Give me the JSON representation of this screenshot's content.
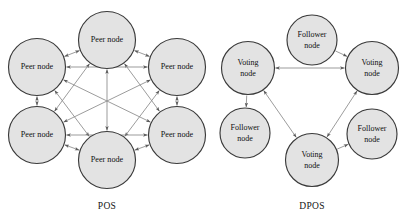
{
  "figure": {
    "background_color": "#ffffff",
    "node_fill_color": "#e3e3e3",
    "node_stroke_color": "#3a3a3a",
    "edge_color": "#8a8a8a"
  },
  "diagrams": [
    {
      "id": "pos",
      "caption": "POS",
      "nodes": [
        {
          "id": "pos-n1",
          "label_line1": "Peer node",
          "label_line2": "",
          "cx": 107,
          "cy": 40,
          "r": 28.5
        },
        {
          "id": "pos-n2",
          "label_line1": "Peer node",
          "label_line2": "",
          "cx": 37,
          "cy": 67,
          "r": 28.5
        },
        {
          "id": "pos-n3",
          "label_line1": "Peer node",
          "label_line2": "",
          "cx": 177,
          "cy": 67,
          "r": 28.5
        },
        {
          "id": "pos-n4",
          "label_line1": "Peer node",
          "label_line2": "",
          "cx": 37,
          "cy": 135,
          "r": 28.5
        },
        {
          "id": "pos-n5",
          "label_line1": "Peer node",
          "label_line2": "",
          "cx": 177,
          "cy": 135,
          "r": 28.5
        },
        {
          "id": "pos-n6",
          "label_line1": "Peer node",
          "label_line2": "",
          "cx": 107,
          "cy": 160,
          "r": 28.5
        }
      ],
      "edges": [
        {
          "from": "pos-n1",
          "to": "pos-n2",
          "bidirectional": true
        },
        {
          "from": "pos-n1",
          "to": "pos-n3",
          "bidirectional": true
        },
        {
          "from": "pos-n1",
          "to": "pos-n4",
          "bidirectional": true
        },
        {
          "from": "pos-n1",
          "to": "pos-n5",
          "bidirectional": true
        },
        {
          "from": "pos-n1",
          "to": "pos-n6",
          "bidirectional": true
        },
        {
          "from": "pos-n2",
          "to": "pos-n3",
          "bidirectional": true
        },
        {
          "from": "pos-n2",
          "to": "pos-n4",
          "bidirectional": true
        },
        {
          "from": "pos-n2",
          "to": "pos-n5",
          "bidirectional": true
        },
        {
          "from": "pos-n2",
          "to": "pos-n6",
          "bidirectional": true
        },
        {
          "from": "pos-n3",
          "to": "pos-n4",
          "bidirectional": true
        },
        {
          "from": "pos-n3",
          "to": "pos-n5",
          "bidirectional": true
        },
        {
          "from": "pos-n3",
          "to": "pos-n6",
          "bidirectional": true
        },
        {
          "from": "pos-n4",
          "to": "pos-n5",
          "bidirectional": true
        },
        {
          "from": "pos-n4",
          "to": "pos-n6",
          "bidirectional": true
        },
        {
          "from": "pos-n5",
          "to": "pos-n6",
          "bidirectional": true
        }
      ],
      "caption_x": 107,
      "caption_y": 207
    },
    {
      "id": "dpos",
      "caption": "DPOS",
      "nodes": [
        {
          "id": "dpos-v1",
          "label_line1": "Voting",
          "label_line2": "node",
          "cx": 248,
          "cy": 68,
          "r": 26.5
        },
        {
          "id": "dpos-v2",
          "label_line1": "Voting",
          "label_line2": "node",
          "cx": 372,
          "cy": 68,
          "r": 26.5
        },
        {
          "id": "dpos-v3",
          "label_line1": "Voting",
          "label_line2": "node",
          "cx": 312,
          "cy": 160,
          "r": 26.5
        },
        {
          "id": "dpos-f1",
          "label_line1": "Follower",
          "label_line2": "node",
          "cx": 312,
          "cy": 40,
          "r": 25.0
        },
        {
          "id": "dpos-f2",
          "label_line1": "Follower",
          "label_line2": "node",
          "cx": 245,
          "cy": 133,
          "r": 25.0
        },
        {
          "id": "dpos-f3",
          "label_line1": "Follower",
          "label_line2": "node",
          "cx": 372,
          "cy": 134,
          "r": 25.0
        }
      ],
      "edges": [
        {
          "from": "dpos-v1",
          "to": "dpos-v2",
          "bidirectional": true
        },
        {
          "from": "dpos-v1",
          "to": "dpos-v3",
          "bidirectional": true
        },
        {
          "from": "dpos-v2",
          "to": "dpos-v3",
          "bidirectional": true
        },
        {
          "from": "dpos-f1",
          "to": "dpos-v2",
          "bidirectional": false
        },
        {
          "from": "dpos-v1",
          "to": "dpos-f2",
          "bidirectional": false
        },
        {
          "from": "dpos-v3",
          "to": "dpos-f3",
          "bidirectional": false
        }
      ],
      "caption_x": 312,
      "caption_y": 207
    }
  ]
}
